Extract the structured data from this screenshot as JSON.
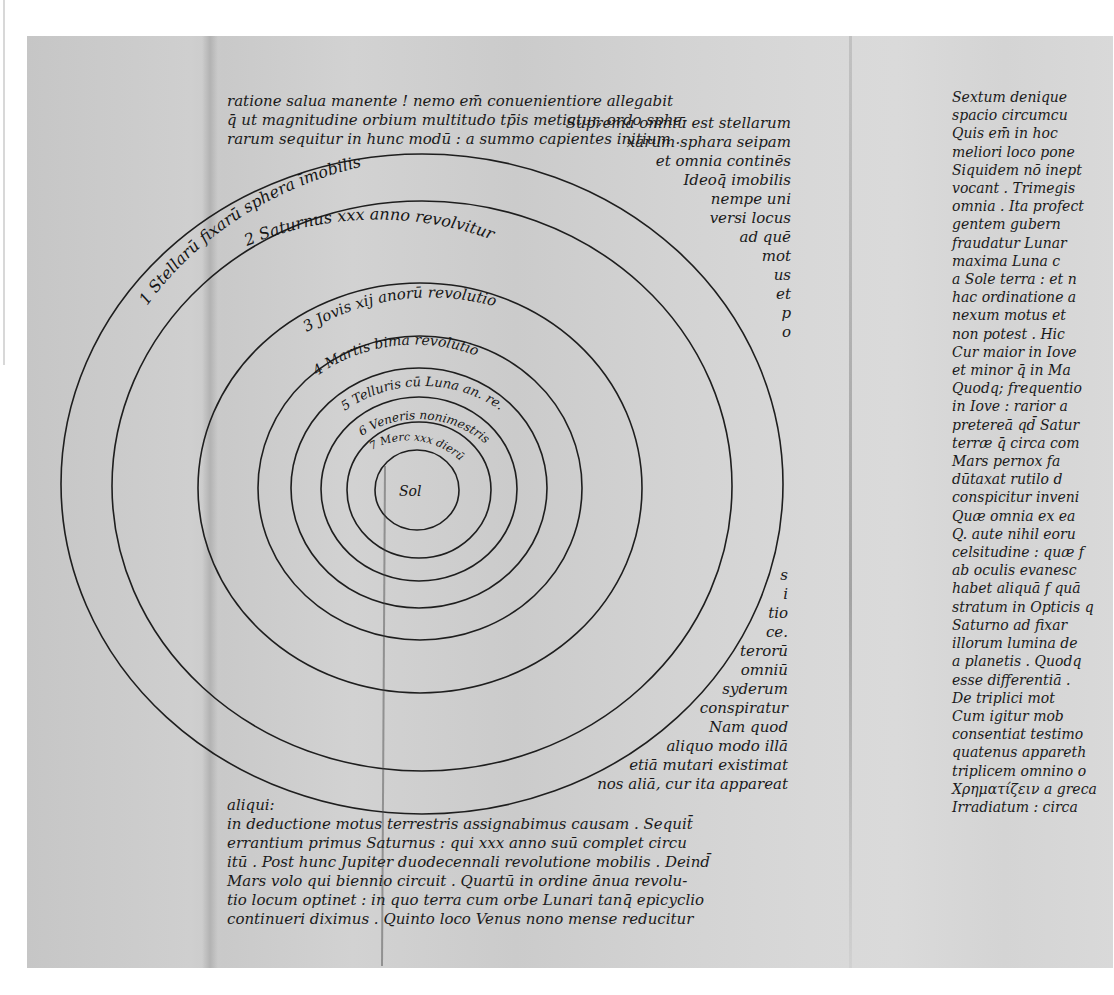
{
  "document": {
    "type": "manuscript-facsimile",
    "description": "Heliocentric diagram of concentric planetary spheres with Latin manuscript text",
    "top_caption": "",
    "colors": {
      "paper": "#cfcfcf",
      "ink": "#1a1a1a",
      "background": "#ffffff"
    }
  },
  "diagram": {
    "center_label": "Sol",
    "orbits": [
      {
        "index": 1,
        "label": "1 Stellarū fixarū sphera īmobilis"
      },
      {
        "index": 2,
        "label": "2 Saturnus xxx anno revolvitur"
      },
      {
        "index": 3,
        "label": "3 Jovis xij anorū revolutio"
      },
      {
        "index": 4,
        "label": "4 Martis bima revolutio"
      },
      {
        "index": 5,
        "label": "5 Telluris cū Luna an. re."
      },
      {
        "index": 6,
        "label": "6 Veneris nonimestris"
      },
      {
        "index": 7,
        "label": "7 Merc xxx dierū"
      }
    ]
  },
  "text": {
    "top_paragraph": [
      "ratione salua manente ! nemo em̄ conuenientiore allegabit",
      "q̄ ut magnitudine orbium multitudo tp̄is metiatur, ordo sphe-",
      "rarum sequitur in hunc modū : a summo capientes initium .",
      "primā et                              Suprema omniū est stellarum",
      "fi"
    ],
    "right_of_diagram": [
      "Suprema omniū est stellarum",
      "xarum sphara seipam",
      "et omnia continēs",
      "Ideoq̄ imobilis",
      "nempe uni",
      "versi locus",
      "ad quē",
      "mot",
      "us",
      "et",
      "p",
      "o"
    ],
    "margin_lower": [
      "s",
      "i",
      "tio",
      "ce.",
      "terorū",
      "omniū",
      "syderum",
      "conspiratur",
      "Nam quod",
      "aliquo modo illā",
      "etiā mutari existimat",
      "nos aliā, cur ita appareat"
    ],
    "bottom_paragraph": [
      "aliqui:",
      "in deductione motus terrestris assignabimus causam . Sequit̄",
      "errantium primus Saturnus : qui xxx anno suū complet circu",
      "itū . Post hunc Jupiter duodecennali revolutione mobilis . Deind̄",
      "Mars volo qui biennio circuit . Quartū in ordine ānua revolu-",
      "tio locum optinet : in quo terra cum orbe Lunari tanq̄ epicyclio",
      "continueri diximus . Quinto loco Venus nono mense reducitur"
    ],
    "right_column": [
      "Sextum denique",
      "spacio circumcu",
      "Quis em̄ in hoc",
      "meliori loco pone",
      "Siquidem nō inept",
      "vocant . Trimegis",
      "omnia . Ita profect",
      "gentem gubern",
      "fraudatur Lunar",
      "maxima Luna c",
      "a Sole terra : et n",
      "hac ordinatione a",
      "nexum motus et",
      "non potest . Hic",
      "Cur maior in Iove",
      "et minor q̄ in Ma",
      "Quodq; frequentio",
      "in Iove : rarior a",
      "pretereā qd̄ Satur",
      "terræ q̄ circa com",
      "Mars pernox fa",
      "dūtaxat rutilo d",
      "conspicitur inveni",
      "Quæ omnia ex ea",
      "Q. aute nihil eoru",
      "celsitudine : quæ f",
      "ab oculis evanesc",
      "habet aliquā f quā",
      "stratum in Opticis q",
      "Saturno ad fixar",
      "illorum lumina de",
      "a planetis . Quodq",
      "esse differentiā .",
      "   De triplici mot",
      "Cum igitur mob",
      "consentiat testimo",
      "quatenus appareth",
      "triplicem omnino o",
      "Χρηματίζειν a greca",
      "Irradiatum : circa"
    ]
  }
}
